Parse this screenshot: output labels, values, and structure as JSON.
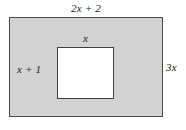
{
  "figure": {
    "type": "shaded-rectangle-with-rectangular-hole",
    "canvas": {
      "width": 186,
      "height": 130,
      "background": "#ffffff"
    },
    "outer_rectangle": {
      "name": "outer-rectangle",
      "fill": "#d2d2d2",
      "stroke": "#4a4a4a",
      "width_label": "2x + 2",
      "height_label": "3x"
    },
    "inner_rectangle": {
      "name": "inner-rectangle",
      "fill": "#ffffff",
      "stroke": "#3d3d3d",
      "width_label": "x",
      "height_label": "x + 1"
    },
    "labels": {
      "top": "2x + 2",
      "right": "3x",
      "inner_left": "x + 1",
      "inner_top": "x"
    }
  }
}
